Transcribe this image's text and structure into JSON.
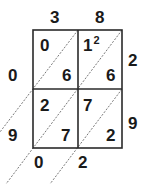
{
  "diagram": {
    "type": "lattice-multiplication",
    "top_digits": [
      "3",
      "8"
    ],
    "right_digits": [
      "2",
      "9"
    ],
    "cells": [
      [
        {
          "tens": "0",
          "ones": "6"
        },
        {
          "tens": "1",
          "tens_carry": "2",
          "ones": "6"
        }
      ],
      [
        {
          "tens": "2",
          "ones": "7"
        },
        {
          "tens": "7",
          "ones": "2"
        }
      ]
    ],
    "left_result_digits": [
      "0",
      "9"
    ],
    "bottom_result_digits": [
      "0",
      "2"
    ],
    "colors": {
      "line": "#2a2a2a",
      "text": "#1a1a1a",
      "diagonal": "#555555"
    }
  }
}
